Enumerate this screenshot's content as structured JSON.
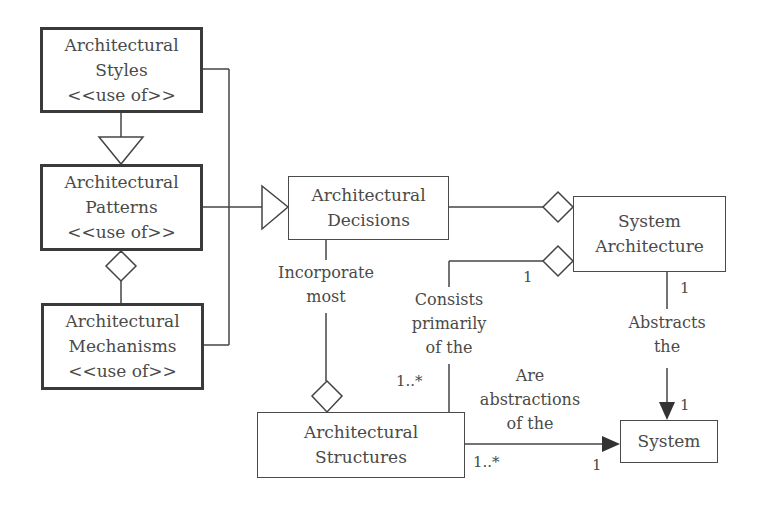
{
  "diagram": {
    "nodes": {
      "styles": {
        "lines": [
          "Architectural",
          "Styles",
          "<<use of>>"
        ]
      },
      "patterns": {
        "lines": [
          "Architectural",
          "Patterns",
          "<<use of>>"
        ]
      },
      "mechanisms": {
        "lines": [
          "Architectural",
          "Mechanisms",
          "<<use of>>"
        ]
      },
      "decisions": {
        "lines": [
          "Architectural",
          "Decisions"
        ]
      },
      "system_architecture": {
        "lines": [
          "System",
          "Architecture"
        ]
      },
      "structures": {
        "lines": [
          "Architectural",
          "Structures"
        ]
      },
      "system": {
        "lines": [
          "System"
        ]
      }
    },
    "edges": {
      "incorporate": {
        "lines": [
          "Incorporate",
          "most"
        ]
      },
      "consists": {
        "lines": [
          "Consists",
          "primarily",
          "of the"
        ]
      },
      "abstracts": {
        "lines": [
          "Abstracts",
          "the"
        ]
      },
      "are_abstractions": {
        "lines": [
          "Are",
          "abstractions",
          "of the"
        ]
      }
    },
    "multiplicities": {
      "consists_sysarch_end": "1",
      "consists_structures_end": "1..*",
      "abstracts_sysarch_end": "1",
      "abstracts_system_end": "1",
      "are_abstractions_structures_end": "1..*",
      "are_abstractions_system_end": "1"
    },
    "colors": {
      "stroke": "#3a3a3a",
      "text": "#4a4a4a",
      "background": "#ffffff"
    }
  }
}
